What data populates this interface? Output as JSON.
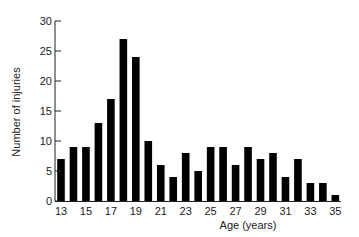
{
  "chart_data": {
    "type": "bar",
    "title": "",
    "xlabel": "Age (years)",
    "ylabel": "Number of injuries",
    "categories": [
      13,
      14,
      15,
      16,
      17,
      18,
      19,
      20,
      21,
      22,
      23,
      24,
      25,
      26,
      27,
      28,
      29,
      30,
      31,
      32,
      33,
      34,
      35
    ],
    "values": [
      7,
      9,
      9,
      13,
      17,
      27,
      24,
      10,
      6,
      4,
      8,
      5,
      9,
      9,
      6,
      9,
      7,
      8,
      4,
      7,
      3,
      3,
      1
    ],
    "x_tick_labels": [
      "13",
      "15",
      "17",
      "19",
      "21",
      "23",
      "25",
      "27",
      "29",
      "31",
      "33",
      "35"
    ],
    "y_ticks": [
      0,
      5,
      10,
      15,
      20,
      25,
      30
    ],
    "ylim": [
      0,
      30
    ],
    "grid": false,
    "legend": null,
    "bar_color": "#000000"
  },
  "labels": {
    "xlabel": "Age (years)",
    "ylabel": "Number of injuries"
  }
}
